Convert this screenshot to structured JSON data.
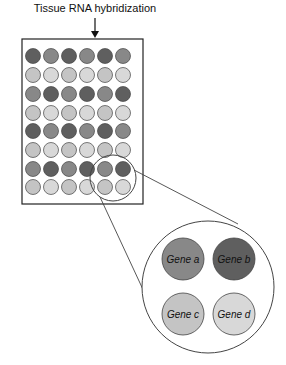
{
  "title": "Tissue RNA hybridization",
  "colors": {
    "dark": "#5f5f5f",
    "medium": "#888888",
    "light": "#c4c4c4",
    "lighter": "#d8d8d8",
    "stroke": "#444444"
  },
  "grid": {
    "rows": 8,
    "cols": 6,
    "shades": [
      [
        "dark",
        "medium",
        "dark",
        "medium",
        "dark",
        "medium"
      ],
      [
        "light",
        "lighter",
        "light",
        "lighter",
        "light",
        "lighter"
      ],
      [
        "medium",
        "dark",
        "medium",
        "dark",
        "medium",
        "dark"
      ],
      [
        "light",
        "lighter",
        "light",
        "lighter",
        "light",
        "lighter"
      ],
      [
        "dark",
        "medium",
        "dark",
        "medium",
        "dark",
        "medium"
      ],
      [
        "light",
        "lighter",
        "light",
        "lighter",
        "light",
        "lighter"
      ],
      [
        "medium",
        "dark",
        "medium",
        "dark",
        "medium",
        "dark"
      ],
      [
        "light",
        "lighter",
        "light",
        "lighter",
        "light",
        "lighter"
      ]
    ]
  },
  "magnified": {
    "genes": [
      {
        "label": "Gene a",
        "shade": "medium"
      },
      {
        "label": "Gene b",
        "shade": "dark"
      },
      {
        "label": "Gene c",
        "shade": "light"
      },
      {
        "label": "Gene d",
        "shade": "lighter"
      }
    ]
  }
}
